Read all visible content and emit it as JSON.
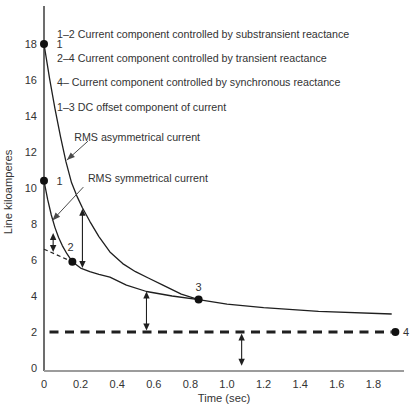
{
  "style": {
    "background": "#ffffff",
    "ink": "#333333",
    "curve_color": "#1f1f1f",
    "dot_color": "#111111",
    "y_axis_color": "#2f2f2f",
    "x_axis_color": "#9c9c9c",
    "pointer_color": "#4a4a4a"
  },
  "chart_data": {
    "type": "line",
    "title": "",
    "xlabel": "Time (sec)",
    "ylabel": "Line kiloamperes",
    "xlim": [
      0,
      2.0
    ],
    "ylim": [
      0,
      20
    ],
    "grid": false,
    "legend_position": "inline-annotations",
    "x_tick_values": [
      0,
      0.2,
      0.4,
      0.6,
      0.8,
      1.0,
      1.2,
      1.4,
      1.6,
      1.8
    ],
    "x_tick_labels": [
      "0",
      "0.2",
      "0.4",
      "0.6",
      "0.8",
      "1.0",
      "1.2",
      "1.4",
      "1.6",
      "1.8"
    ],
    "y_tick_values": [
      0,
      2,
      4,
      6,
      8,
      10,
      12,
      14,
      16,
      18
    ],
    "y_tick_labels": [
      "0",
      "2",
      "4",
      "6",
      "8",
      "10",
      "12",
      "14",
      "16",
      "18"
    ],
    "series": [
      {
        "name": "RMS asymmetrical current",
        "line": "solid",
        "points": [
          [
            0,
            18
          ],
          [
            0.03,
            16.1
          ],
          [
            0.06,
            14.4
          ],
          [
            0.09,
            12.85
          ],
          [
            0.12,
            11.45
          ],
          [
            0.15,
            10.3
          ],
          [
            0.18,
            9.55
          ],
          [
            0.21,
            8.9
          ],
          [
            0.25,
            8.15
          ],
          [
            0.3,
            7.3
          ],
          [
            0.36,
            6.45
          ],
          [
            0.43,
            5.8
          ],
          [
            0.5,
            5.35
          ],
          [
            0.57,
            5.0
          ],
          [
            0.65,
            4.6
          ],
          [
            0.75,
            4.1
          ],
          [
            0.845,
            3.8
          ]
        ]
      },
      {
        "name": "RMS symmetrical current",
        "line": "solid",
        "points": [
          [
            0,
            10.4
          ],
          [
            0.02,
            9.35
          ],
          [
            0.04,
            8.5
          ],
          [
            0.06,
            7.8
          ],
          [
            0.08,
            7.25
          ],
          [
            0.1,
            6.8
          ],
          [
            0.125,
            6.35
          ],
          [
            0.155,
            5.9
          ],
          [
            0.2,
            5.55
          ],
          [
            0.25,
            5.35
          ],
          [
            0.3,
            5.2
          ],
          [
            0.36,
            5.05
          ],
          [
            0.45,
            4.6
          ],
          [
            0.56,
            4.25
          ],
          [
            0.7,
            4.0
          ],
          [
            0.845,
            3.8
          ],
          [
            1.0,
            3.55
          ],
          [
            1.2,
            3.35
          ],
          [
            1.5,
            3.15
          ],
          [
            1.9,
            3.0
          ]
        ]
      },
      {
        "name": "transient component extrapolation",
        "line": "dashed-thin",
        "points": [
          [
            0,
            6.6
          ],
          [
            0.155,
            5.9
          ]
        ]
      },
      {
        "name": "sustained synchronous current level",
        "line": "dashed-thick",
        "points": [
          [
            0.03,
            2
          ],
          [
            1.9,
            2
          ]
        ]
      }
    ],
    "markers": [
      {
        "label": "1",
        "x": 0,
        "y": 18,
        "label_x": 0.068,
        "label_y": 18,
        "anchor": "start"
      },
      {
        "label": "1",
        "x": 0,
        "y": 10.4,
        "label_x": 0.068,
        "label_y": 10.4,
        "anchor": "start"
      },
      {
        "label": "2",
        "x": 0.155,
        "y": 5.9,
        "label_x": 0.145,
        "label_y": 6.7,
        "anchor": "middle"
      },
      {
        "label": "3",
        "x": 0.845,
        "y": 3.8,
        "label_x": 0.845,
        "label_y": 4.5,
        "anchor": "middle"
      },
      {
        "label": "4",
        "x": 1.92,
        "y": 2.0,
        "label_x": 1.962,
        "label_y": 2.0,
        "anchor": "start"
      }
    ],
    "range_arrows": [
      {
        "name": "subtransient-component-arrow",
        "x": 0.05,
        "y1": 6.45,
        "y2": 7.5
      },
      {
        "name": "dc-offset-component-arrow",
        "x": 0.21,
        "y1": 5.55,
        "y2": 8.85
      },
      {
        "name": "transient-component-arrow",
        "x": 0.56,
        "y1": 2.08,
        "y2": 4.25
      },
      {
        "name": "synchronous-component-arrow",
        "x": 1.08,
        "y1": 0.12,
        "y2": 1.92
      }
    ],
    "callouts": [
      {
        "text": "RMS asymmetrical current",
        "text_x": 0.165,
        "text_y": 12.85,
        "from": [
          0.24,
          12.6
        ],
        "to": [
          0.125,
          11.55
        ]
      },
      {
        "text": "RMS symmetrical current",
        "text_x": 0.24,
        "text_y": 10.55,
        "from": [
          0.215,
          10.05
        ],
        "to": [
          0.046,
          8.2
        ]
      }
    ],
    "legend_notes": [
      {
        "text": "1–2 Current component controlled by substransient reactance",
        "x": 0.071,
        "y": 18.55
      },
      {
        "text": "2–4 Current component controlled by transient reactance",
        "x": 0.071,
        "y": 17.2
      },
      {
        "text": "4– Current component controlled by synchronous reactance",
        "x": 0.071,
        "y": 15.9
      },
      {
        "text": "1–3 DC offset component of current",
        "x": 0.071,
        "y": 14.5
      }
    ]
  }
}
